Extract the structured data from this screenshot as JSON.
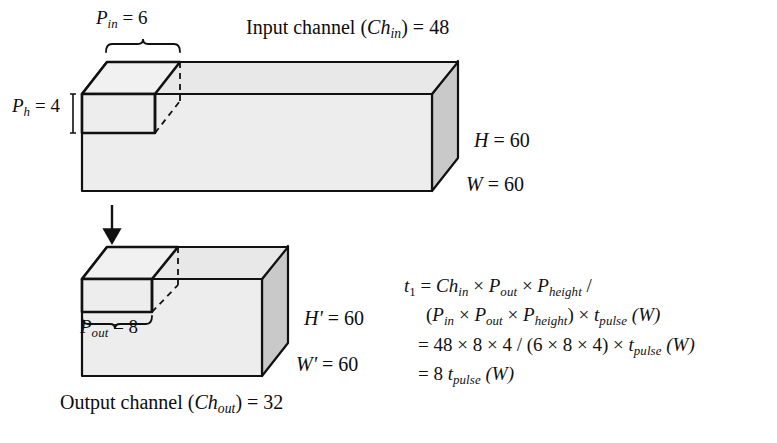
{
  "figure": {
    "colors": {
      "face_front": "#ededed",
      "face_top": "#e6e6e6",
      "face_side": "#c9c9c9",
      "outline": "#111111",
      "background": "#ffffff"
    },
    "input_block": {
      "patch_width_label": {
        "symbol": "P",
        "sub": "in",
        "eq": "= 6",
        "text": "P_in = 6"
      },
      "patch_height_label": {
        "symbol": "P",
        "sub": "h",
        "eq": "= 4",
        "text": "P_h = 4"
      },
      "channel_label": {
        "prefix": "Input channel (",
        "symbol": "Ch",
        "sub": "in",
        "suffix": ") = 48",
        "text": "Input channel (Ch_in) = 48"
      },
      "height_label": {
        "symbol": "H",
        "eq": "= 60",
        "text": "H = 60"
      },
      "width_label": {
        "symbol": "W",
        "eq": "= 60",
        "text": "W = 60"
      }
    },
    "output_block": {
      "patch_width_label": {
        "symbol": "P",
        "sub": "out",
        "eq": "= 8",
        "text": "P_out = 8"
      },
      "channel_label": {
        "prefix": "Output channel (",
        "symbol": "Ch",
        "sub": "out",
        "suffix": ") = 32",
        "text": "Output channel (Ch_out) = 32"
      },
      "height_label": {
        "symbol": "H'",
        "eq": "= 60",
        "text": "H' = 60"
      },
      "width_label": {
        "symbol": "W'",
        "eq": "= 60",
        "text": "W' = 60"
      }
    },
    "arrow": {
      "name": "downward-arrow",
      "direction": "down"
    }
  },
  "equation": {
    "line1": {
      "lhs_symbol": "t",
      "lhs_sub": "1",
      "equals": "=",
      "terms": [
        {
          "symbol": "Ch",
          "sub": "in"
        },
        {
          "symbol": "P",
          "sub": "out"
        },
        {
          "symbol": "P",
          "sub": "height"
        }
      ],
      "operator": "×",
      "trailing": "/",
      "text": "t_1 = Ch_in × P_out × P_height /"
    },
    "line2": {
      "open": "(",
      "terms": [
        {
          "symbol": "P",
          "sub": "in"
        },
        {
          "symbol": "P",
          "sub": "out"
        },
        {
          "symbol": "P",
          "sub": "height"
        }
      ],
      "close": ")",
      "operator": "×",
      "tail_symbol": "t",
      "tail_sub": "pulse",
      "tail_paren": "(W)",
      "text": "(P_in × P_out × P_height) × t_pulse (W)"
    },
    "line3": {
      "equals": "=",
      "numerator": "48 × 8 × 4",
      "slash": "/",
      "denominator": "(6 × 8 × 4)",
      "operator": "×",
      "tail_symbol": "t",
      "tail_sub": "pulse",
      "tail_paren": "(W)",
      "text": "= 48 × 8 × 4 / (6 × 8 × 4) × t_pulse (W)"
    },
    "line4": {
      "equals": "=",
      "coefficient": "8",
      "tail_symbol": "t",
      "tail_sub": "pulse",
      "tail_paren": "(W)",
      "text": "= 8 t_pulse (W)"
    }
  }
}
